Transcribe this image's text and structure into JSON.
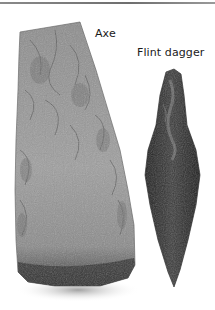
{
  "labels": {
    "axe": "Axe",
    "dagger": "Flint dagger"
  },
  "artifacts": [
    {
      "name": "axe",
      "material": "flint",
      "tone": "grey"
    },
    {
      "name": "flint dagger",
      "material": "flint",
      "tone": "dark grey"
    }
  ],
  "colors": {
    "background": "#ffffff",
    "top_rule": "#7a7a7a",
    "axe_light": "#9a9a9a",
    "axe_dark": "#3a3a3a",
    "dagger_dark": "#2a2a2a",
    "label_text": "#1a1a1a"
  }
}
